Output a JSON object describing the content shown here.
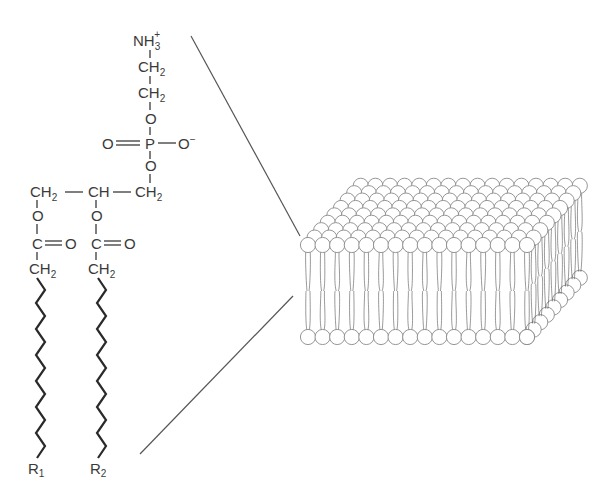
{
  "figure": {
    "molecule": {
      "headgroup": {
        "amine": "NH",
        "amine_sub": "3",
        "amine_charge": "+",
        "ch2_a": "CH",
        "ch2_a_sub": "2",
        "ch2_b": "CH",
        "ch2_b_sub": "2",
        "o_top": "O",
        "o_double": "O",
        "phosphorus": "P",
        "o_minus": "O",
        "o_minus_charge": "−",
        "o_bottom": "O"
      },
      "glycerol": {
        "ch2_left": "CH",
        "ch2_left_sub": "2",
        "ch": "CH",
        "ch2_right": "CH",
        "ch2_right_sub": "2"
      },
      "ester1": {
        "o": "O",
        "c": "C",
        "o_double": "O",
        "ch2": "CH",
        "ch2_sub": "2"
      },
      "ester2": {
        "o": "O",
        "c": "C",
        "o_double": "O",
        "ch2": "CH",
        "ch2_sub": "2"
      },
      "tails": [
        {
          "label": "R",
          "label_sub": "1",
          "segments": 14
        },
        {
          "label": "R",
          "label_sub": "2",
          "segments": 14
        }
      ]
    },
    "bilayer": {
      "description": "3D lipid bilayer sheet",
      "front_row_heads": 16,
      "depth_rows": 9,
      "head_color": "#ffffff",
      "outline_color": "#8a8a8a"
    },
    "connector_lines": 2
  }
}
